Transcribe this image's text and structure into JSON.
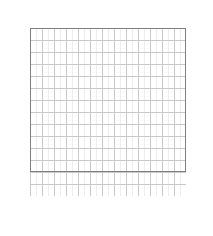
{
  "figure": {
    "type": "lattice-dot-grid",
    "grid": {
      "columns": 13,
      "rows": 14,
      "cell_px": 12,
      "origin_x_px": 30,
      "origin_y_px": 28,
      "outline_rows": [
        14,
        3
      ]
    },
    "axes": {
      "top_labels": [
        "13",
        "12",
        "11",
        "10",
        "9",
        "8",
        "7",
        "6",
        "5",
        "4",
        "3",
        "2",
        "1"
      ],
      "bottom_labels": [
        "13",
        "12",
        "11",
        "10",
        "9",
        "8",
        "7",
        "6",
        "5",
        "4",
        "3",
        "2",
        "1"
      ],
      "left_labels": [
        "14",
        "12",
        "10",
        "8",
        "6",
        "4",
        "2"
      ],
      "right_labels": [
        "13",
        "11",
        "9",
        "7",
        "5",
        "3",
        "1"
      ]
    },
    "colors": {
      "dot": "#1b1b1b",
      "gridline": "#c9c9c9",
      "subgridline": "#ececec",
      "outline": "#808080",
      "text": "#1a1a1a",
      "background": "#ffffff"
    }
  },
  "chart_data": {
    "type": "scatter",
    "title": "",
    "xlabel": "",
    "ylabel": "",
    "xlim": [
      13,
      1
    ],
    "ylim": [
      1,
      14
    ],
    "grid": true,
    "legend": null,
    "x_tick_labels": [
      "13",
      "12",
      "11",
      "10",
      "9",
      "8",
      "7",
      "6",
      "5",
      "4",
      "3",
      "2",
      "1"
    ],
    "y_tick_labels_left": [
      "14",
      "12",
      "10",
      "8",
      "6",
      "4",
      "2"
    ],
    "y_tick_labels_right": [
      "13",
      "11",
      "9",
      "7",
      "5",
      "3",
      "1"
    ],
    "note": "Diamond lattice of filled dots. Row index = y label, column index = x label (x decreases left to right).",
    "rows": [
      {
        "row": 14,
        "cols": [
          7
        ]
      },
      {
        "row": 13,
        "cols": [
          8,
          6
        ]
      },
      {
        "row": 12,
        "cols": [
          9,
          7,
          5
        ]
      },
      {
        "row": 11,
        "cols": [
          10,
          8,
          6,
          4
        ]
      },
      {
        "row": 10,
        "cols": [
          11,
          9,
          7,
          5,
          3
        ]
      },
      {
        "row": 9,
        "cols": [
          12,
          10,
          8,
          6,
          4,
          2
        ]
      },
      {
        "row": 8,
        "cols": [
          13,
          11,
          9,
          7,
          5,
          3,
          1
        ]
      },
      {
        "row": 7,
        "cols": [
          12,
          10,
          8,
          6,
          4
        ]
      },
      {
        "row": 6,
        "cols": [
          11,
          9,
          7,
          5
        ]
      },
      {
        "row": 5,
        "cols": [
          10,
          8,
          6
        ]
      },
      {
        "row": 4,
        "cols": [
          9,
          7
        ]
      },
      {
        "row": 3,
        "cols": [
          8
        ]
      }
    ],
    "points": [
      {
        "x": 7,
        "y": 14
      },
      {
        "x": 8,
        "y": 13
      },
      {
        "x": 6,
        "y": 13
      },
      {
        "x": 9,
        "y": 12
      },
      {
        "x": 7,
        "y": 12
      },
      {
        "x": 5,
        "y": 12
      },
      {
        "x": 10,
        "y": 11
      },
      {
        "x": 8,
        "y": 11
      },
      {
        "x": 6,
        "y": 11
      },
      {
        "x": 4,
        "y": 11
      },
      {
        "x": 11,
        "y": 10
      },
      {
        "x": 9,
        "y": 10
      },
      {
        "x": 7,
        "y": 10
      },
      {
        "x": 5,
        "y": 10
      },
      {
        "x": 3,
        "y": 10
      },
      {
        "x": 12,
        "y": 9
      },
      {
        "x": 10,
        "y": 9
      },
      {
        "x": 8,
        "y": 9
      },
      {
        "x": 6,
        "y": 9
      },
      {
        "x": 4,
        "y": 9
      },
      {
        "x": 2,
        "y": 9
      },
      {
        "x": 13,
        "y": 8
      },
      {
        "x": 11,
        "y": 8
      },
      {
        "x": 9,
        "y": 8
      },
      {
        "x": 7,
        "y": 8
      },
      {
        "x": 5,
        "y": 8
      },
      {
        "x": 3,
        "y": 8
      },
      {
        "x": 1,
        "y": 8
      },
      {
        "x": 12,
        "y": 7
      },
      {
        "x": 10,
        "y": 7
      },
      {
        "x": 8,
        "y": 7
      },
      {
        "x": 6,
        "y": 7
      },
      {
        "x": 4,
        "y": 7
      },
      {
        "x": 11,
        "y": 6
      },
      {
        "x": 9,
        "y": 6
      },
      {
        "x": 7,
        "y": 6
      },
      {
        "x": 5,
        "y": 6
      },
      {
        "x": 10,
        "y": 5
      },
      {
        "x": 8,
        "y": 5
      },
      {
        "x": 6,
        "y": 5
      },
      {
        "x": 9,
        "y": 4
      },
      {
        "x": 7,
        "y": 4
      },
      {
        "x": 8,
        "y": 3
      }
    ]
  }
}
